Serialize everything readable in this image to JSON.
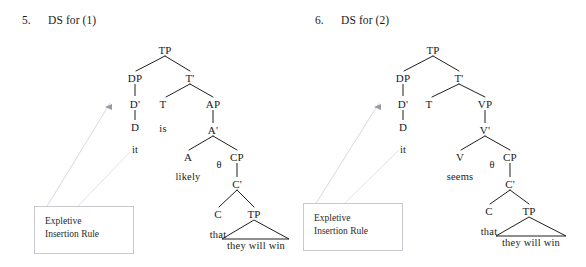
{
  "document": {
    "kind": "syntax-tree-figure-pair",
    "background_color": "#ffffff",
    "text_color": "#1a1a1a",
    "line_color": "#1f1f1f",
    "faint_line_color": "#d2d2d8",
    "box_border_color": "#c9c9cf"
  },
  "figures": [
    {
      "number": "5.",
      "title": "DS for (1)",
      "rule_box": {
        "line1": "Expletive",
        "line2": "Insertion Rule"
      },
      "arrow": {
        "name": "expletive-insertion-arrow",
        "direction": "left"
      },
      "nodes": [
        {
          "label": "TP",
          "x": 165,
          "y": 50
        },
        {
          "label": "DP",
          "x": 135,
          "y": 78
        },
        {
          "label": "T'",
          "x": 190,
          "y": 78
        },
        {
          "label": "D'",
          "x": 135,
          "y": 104
        },
        {
          "label": "T",
          "x": 163,
          "y": 104
        },
        {
          "label": "AP",
          "x": 213,
          "y": 104
        },
        {
          "label": "D",
          "x": 135,
          "y": 127
        },
        {
          "label": "is",
          "x": 163,
          "y": 127
        },
        {
          "label": "A'",
          "x": 213,
          "y": 130
        },
        {
          "label": "it",
          "x": 135,
          "y": 148
        },
        {
          "label": "A",
          "x": 188,
          "y": 157
        },
        {
          "label": "θ",
          "x": 219,
          "y": 163
        },
        {
          "label": "CP",
          "x": 237,
          "y": 157
        },
        {
          "label": "likely",
          "x": 188,
          "y": 176
        },
        {
          "label": "C'",
          "x": 237,
          "y": 184
        },
        {
          "label": "C",
          "x": 218,
          "y": 214
        },
        {
          "label": "TP",
          "x": 254,
          "y": 214
        },
        {
          "label": "that",
          "x": 218,
          "y": 234
        },
        {
          "label": "they will win",
          "x": 254,
          "y": 249
        }
      ]
    },
    {
      "number": "6.",
      "title": "DS for (2)",
      "rule_box": {
        "line1": "Expletive",
        "line2": "Insertion Rule"
      },
      "arrow": {
        "name": "expletive-insertion-arrow",
        "direction": "left"
      },
      "nodes": [
        {
          "label": "TP",
          "x": 140,
          "y": 50
        },
        {
          "label": "DP",
          "x": 110,
          "y": 78
        },
        {
          "label": "T'",
          "x": 166,
          "y": 78
        },
        {
          "label": "D'",
          "x": 110,
          "y": 104
        },
        {
          "label": "T",
          "x": 136,
          "y": 104
        },
        {
          "label": "VP",
          "x": 192,
          "y": 104
        },
        {
          "label": "D",
          "x": 110,
          "y": 127
        },
        {
          "label": "V'",
          "x": 192,
          "y": 130
        },
        {
          "label": "it",
          "x": 110,
          "y": 148
        },
        {
          "label": "V",
          "x": 167,
          "y": 157
        },
        {
          "label": "θ",
          "x": 199,
          "y": 163
        },
        {
          "label": "CP",
          "x": 217,
          "y": 157
        },
        {
          "label": "seems",
          "x": 167,
          "y": 176
        },
        {
          "label": "C'",
          "x": 217,
          "y": 184
        },
        {
          "label": "C",
          "x": 196,
          "y": 211
        },
        {
          "label": "TP",
          "x": 236,
          "y": 211
        },
        {
          "label": "that",
          "x": 196,
          "y": 231
        },
        {
          "label": "they will win",
          "x": 236,
          "y": 246
        }
      ]
    }
  ]
}
